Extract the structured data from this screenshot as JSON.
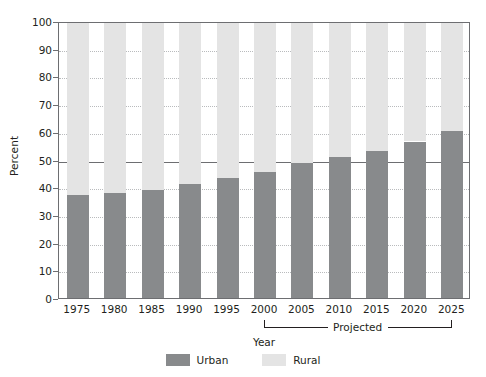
{
  "chart_data": {
    "type": "bar",
    "subtype": "stacked-100-percent",
    "title": "",
    "xlabel": "Year",
    "ylabel": "Percent",
    "categories": [
      "1975",
      "1980",
      "1985",
      "1990",
      "1995",
      "2000",
      "2005",
      "2010",
      "2015",
      "2020",
      "2025"
    ],
    "series": [
      {
        "name": "Urban",
        "color": "#888a8c",
        "values": [
          37.2,
          37.9,
          39.1,
          41.0,
          43.2,
          45.5,
          48.6,
          50.9,
          53.0,
          56.5,
          60.3
        ]
      },
      {
        "name": "Rural",
        "color": "#e4e4e4",
        "values": [
          62.8,
          62.1,
          60.9,
          59.0,
          56.8,
          54.5,
          51.4,
          49.1,
          47.0,
          43.5,
          39.7
        ]
      }
    ],
    "ylim": [
      0,
      100
    ],
    "yticks": [
      0,
      10,
      20,
      30,
      40,
      50,
      60,
      70,
      80,
      90,
      100
    ],
    "ytick_labels": [
      "0",
      "10",
      "20",
      "30",
      "40",
      "50",
      "60",
      "70",
      "80",
      "90",
      "100"
    ],
    "grid": true,
    "grid_style": "dotted",
    "reference_line": {
      "value": 50,
      "color": "#6d6e71",
      "style": "solid"
    },
    "legend_position": "bottom",
    "legend": [
      "Urban",
      "Rural"
    ],
    "annotations": [
      {
        "name": "projected-bracket",
        "label": "Projected",
        "from_category": "2000",
        "to_category": "2025"
      }
    ]
  },
  "axes": {
    "y_title": "Percent",
    "x_title": "Year"
  },
  "legend": {
    "items": [
      {
        "label": "Urban",
        "color": "#888a8c"
      },
      {
        "label": "Rural",
        "color": "#e4e4e4"
      }
    ]
  },
  "annotation": {
    "projected_label": "Projected"
  }
}
